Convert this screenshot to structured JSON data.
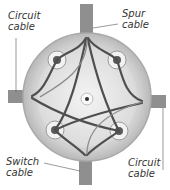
{
  "labels": {
    "top_left": {
      "line1": "Circuit",
      "line2": "cable"
    },
    "top_right": {
      "line1": "Spur",
      "line2": "cable"
    },
    "bottom_left": {
      "line1": "Switch",
      "line2": "cable"
    },
    "bottom_right": {
      "line1": "Circuit",
      "line2": "cable"
    }
  },
  "colors": {
    "box_fill": "#e6e6e6",
    "box_rim": "#bdbdbd",
    "cable_sheath": "#8a8a8a",
    "wire": "#4a4a4a",
    "leader_line": "#555555"
  }
}
